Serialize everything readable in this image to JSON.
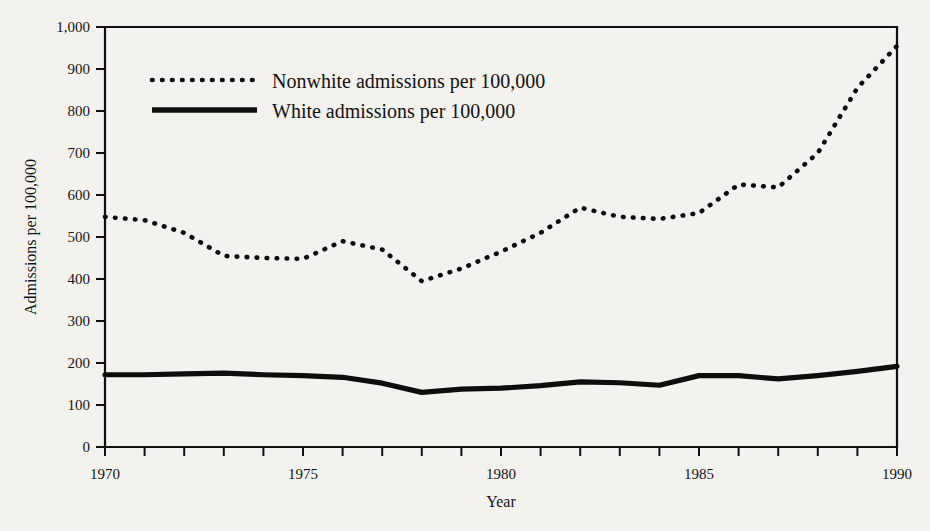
{
  "chart_data": {
    "type": "line",
    "title": "",
    "xlabel": "Year",
    "ylabel": "Admissions per 100,000",
    "xlim": [
      1970,
      1990
    ],
    "ylim": [
      0,
      1000
    ],
    "grid": false,
    "legend_position": "top-left-inside",
    "y_ticks": [
      0,
      100,
      200,
      300,
      400,
      500,
      600,
      700,
      800,
      900,
      1000
    ],
    "y_tick_labels": [
      "0",
      "100",
      "200",
      "300",
      "400",
      "500",
      "600",
      "700",
      "800",
      "900",
      "1,000"
    ],
    "x_ticks": [
      1970,
      1971,
      1972,
      1973,
      1974,
      1975,
      1976,
      1977,
      1978,
      1979,
      1980,
      1981,
      1982,
      1983,
      1984,
      1985,
      1986,
      1987,
      1988,
      1989,
      1990
    ],
    "x_tick_labels_shown": [
      "1970",
      "1975",
      "1980",
      "1985",
      "1990"
    ],
    "x_tick_labels_shown_values": [
      1970,
      1975,
      1980,
      1985,
      1990
    ],
    "x": [
      1970,
      1971,
      1972,
      1973,
      1974,
      1975,
      1976,
      1977,
      1978,
      1979,
      1980,
      1981,
      1982,
      1983,
      1984,
      1985,
      1986,
      1987,
      1988,
      1989,
      1990
    ],
    "series": [
      {
        "name": "Nonwhite admissions per 100,000",
        "style": "dotted",
        "color": "#0d0d0d",
        "values": [
          548,
          540,
          510,
          455,
          450,
          448,
          490,
          470,
          395,
          425,
          465,
          510,
          570,
          548,
          543,
          557,
          625,
          618,
          700,
          855,
          955
        ]
      },
      {
        "name": "White admissions per 100,000",
        "style": "solid",
        "color": "#0d0d0d",
        "values": [
          172,
          172,
          174,
          176,
          172,
          170,
          166,
          152,
          130,
          138,
          140,
          146,
          155,
          153,
          147,
          170,
          170,
          162,
          170,
          180,
          192
        ]
      }
    ],
    "legend": [
      {
        "label": "Nonwhite admissions per 100,000",
        "style": "dotted"
      },
      {
        "label": "White admissions per 100,000",
        "style": "solid"
      }
    ]
  }
}
